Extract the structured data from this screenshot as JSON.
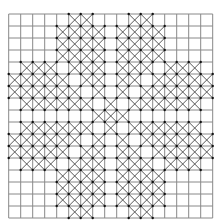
{
  "figure": {
    "type": "grid-pattern",
    "rows": 17,
    "cols": 17,
    "origin_x": 8.7,
    "origin_y": 14,
    "cell_size": 12,
    "grid_color": "#888888",
    "cross_color": "#444444",
    "dot_color": "#111111",
    "crossed_cells_by_row": [
      [
        5,
        6,
        10,
        11
      ],
      [
        4,
        5,
        6,
        7,
        9,
        10,
        11,
        12
      ],
      [
        4,
        5,
        6,
        7,
        9,
        10,
        11,
        12
      ],
      [
        4,
        5,
        6,
        7,
        9,
        10,
        11,
        12
      ],
      [
        1,
        2,
        3,
        5,
        6,
        7,
        9,
        10,
        11,
        13,
        14,
        15
      ],
      [
        0,
        1,
        2,
        3,
        4,
        6,
        7,
        9,
        10,
        12,
        13,
        14,
        15,
        16
      ],
      [
        0,
        1,
        2,
        3,
        4,
        5,
        7,
        9,
        11,
        12,
        13,
        14,
        15,
        16
      ],
      [
        1,
        2,
        3,
        4,
        5,
        6,
        8,
        10,
        11,
        12,
        13,
        14,
        15
      ],
      [
        7,
        8,
        9
      ],
      [
        1,
        2,
        3,
        4,
        5,
        6,
        8,
        10,
        11,
        12,
        13,
        14,
        15
      ],
      [
        0,
        1,
        2,
        3,
        4,
        5,
        7,
        9,
        11,
        12,
        13,
        14,
        15,
        16
      ],
      [
        0,
        1,
        2,
        3,
        4,
        6,
        7,
        9,
        10,
        12,
        13,
        14,
        15,
        16
      ],
      [
        1,
        2,
        3,
        5,
        6,
        7,
        9,
        10,
        11,
        13,
        14,
        15
      ],
      [
        4,
        5,
        6,
        7,
        9,
        10,
        11,
        12
      ],
      [
        4,
        5,
        6,
        7,
        9,
        10,
        11,
        12
      ],
      [
        4,
        5,
        6,
        7,
        9,
        10,
        11,
        12
      ],
      [
        5,
        6,
        10,
        11
      ]
    ]
  }
}
